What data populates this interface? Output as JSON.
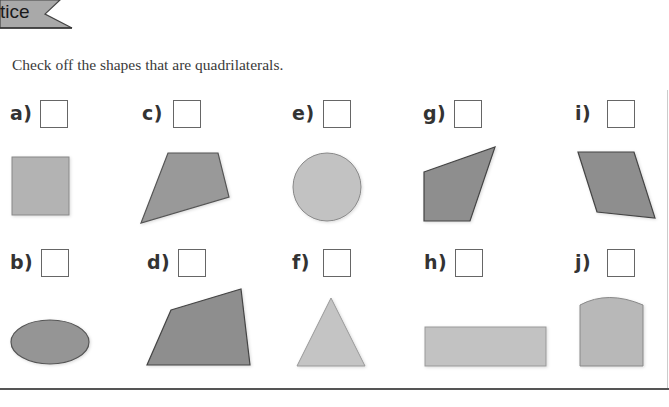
{
  "header": {
    "tab_label": "tice"
  },
  "instruction": "Check off the shapes that are quadrilaterals.",
  "items": [
    {
      "id": "a",
      "label": "a)",
      "shape": "square",
      "checked": false
    },
    {
      "id": "b",
      "label": "b)",
      "shape": "ellipse",
      "checked": false
    },
    {
      "id": "c",
      "label": "c)",
      "shape": "quadrilateral-trapezoid",
      "checked": false
    },
    {
      "id": "d",
      "label": "d)",
      "shape": "quadrilateral-irregular",
      "checked": false
    },
    {
      "id": "e",
      "label": "e)",
      "shape": "circle",
      "checked": false
    },
    {
      "id": "f",
      "label": "f)",
      "shape": "triangle",
      "checked": false
    },
    {
      "id": "g",
      "label": "g)",
      "shape": "quadrilateral-kite",
      "checked": false
    },
    {
      "id": "h",
      "label": "h)",
      "shape": "rectangle",
      "checked": false
    },
    {
      "id": "i",
      "label": "i)",
      "shape": "parallelogram",
      "checked": false
    },
    {
      "id": "j",
      "label": "j)",
      "shape": "arch-top-rectangle",
      "checked": false
    }
  ],
  "colors": {
    "shape_dark": "#8e8e8e",
    "shape_light": "#b8b8b8",
    "stroke": "#555555",
    "tab_fill": "#a9a9a9"
  }
}
